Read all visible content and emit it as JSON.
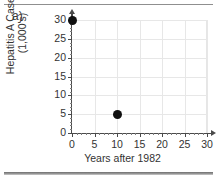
{
  "figure": {
    "panel_label": "a)",
    "accent_color": "#101010",
    "grid_color": "#e7e7e7",
    "axis_color": "#4a4a4a"
  },
  "chart_data": {
    "type": "scatter",
    "title": "",
    "xlabel": "Years after 1982",
    "ylabel": "Hepatitis A Cases (1,000's)",
    "ylabel_line1": "Hepatitis A Cases",
    "ylabel_line2": "(1,000's)",
    "x": [
      0,
      10
    ],
    "values": [
      30,
      5
    ],
    "points": [
      {
        "x": 0,
        "y": 30
      },
      {
        "x": 10,
        "y": 5
      }
    ],
    "xlim": [
      0,
      30
    ],
    "ylim": [
      0,
      30
    ],
    "xticks": [
      0,
      5,
      10,
      15,
      20,
      25,
      30
    ],
    "yticks": [
      0,
      5,
      10,
      15,
      20,
      25,
      30
    ],
    "xtick_labels": [
      "0",
      "5",
      "10",
      "15",
      "20",
      "25",
      "30"
    ],
    "ytick_labels": [
      "0",
      "5",
      "10",
      "15",
      "20",
      "25",
      "30"
    ],
    "grid": true,
    "legend": "none",
    "marker": "filled-circle"
  }
}
